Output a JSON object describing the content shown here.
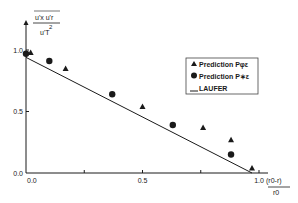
{
  "chart_data": {
    "type": "scatter",
    "title": "",
    "ylabel": {
      "numerator": "u'x u'r",
      "denominator": "u'T^2"
    },
    "xlabel": {
      "numerator": "(r0-r)",
      "denominator": "r0"
    },
    "xlim": [
      0,
      1.0
    ],
    "ylim": [
      0,
      1.0
    ],
    "x_ticks": [
      {
        "value": 0.0,
        "label": "0.0"
      },
      {
        "value": 0.5,
        "label": "0.5"
      },
      {
        "value": 1.0,
        "label": "1.0"
      }
    ],
    "y_ticks": [
      {
        "value": 0.0,
        "label": "0.0"
      },
      {
        "value": 0.5,
        "label": "0.5"
      },
      {
        "value": 1.0,
        "label": "1.0"
      }
    ],
    "grid": false,
    "legend_position": "upper right",
    "legend": [
      {
        "marker": "triangle",
        "label": "Prediction  Pφε"
      },
      {
        "marker": "circle",
        "label": "Prediction  P∗ε"
      },
      {
        "marker": "line",
        "label": "LAUFER"
      }
    ],
    "series": [
      {
        "name": "Prediction Pφε",
        "marker": "triangle",
        "x": [
          0.02,
          0.17,
          0.5,
          0.76,
          0.88,
          0.97
        ],
        "y": [
          0.98,
          0.85,
          0.54,
          0.37,
          0.27,
          0.04
        ]
      },
      {
        "name": "Prediction P∗ε",
        "marker": "circle",
        "x": [
          0.0,
          0.1,
          0.37,
          0.63,
          0.88
        ],
        "y": [
          0.97,
          0.91,
          0.64,
          0.39,
          0.15
        ]
      },
      {
        "name": "LAUFER",
        "marker": "line",
        "x": [
          0.0,
          0.97
        ],
        "y": [
          0.94,
          0.0
        ]
      }
    ]
  }
}
